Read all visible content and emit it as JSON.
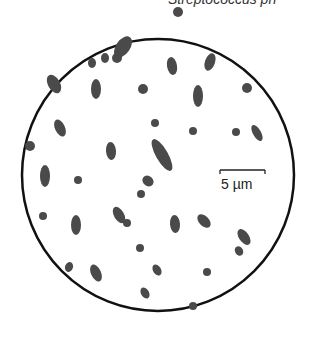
{
  "figure": {
    "caption_partial": "Streptococcus pn",
    "scale_bar_label": "5 µm",
    "colors": {
      "outline": "#111111",
      "cells": "#4a4a4a",
      "background": "#ffffff"
    }
  },
  "field_of_view": {
    "cx": 158,
    "cy": 175,
    "r": 136
  },
  "scale_bar": {
    "x1": 220,
    "x2": 265,
    "y": 170
  },
  "cells": [
    [
      123,
      47,
      12,
      7,
      35
    ],
    [
      117,
      58,
      5,
      5,
      0
    ],
    [
      105,
      58,
      5,
      4,
      0
    ],
    [
      92,
      63,
      5,
      4,
      0
    ],
    [
      54,
      84,
      6,
      10,
      60
    ],
    [
      96,
      89,
      10,
      5,
      0
    ],
    [
      143,
      89,
      5,
      5,
      0
    ],
    [
      178,
      12,
      5,
      5,
      0
    ],
    [
      172,
      66,
      5,
      9,
      80
    ],
    [
      210,
      62,
      9,
      5,
      20
    ],
    [
      198,
      96,
      5,
      11,
      90
    ],
    [
      247,
      88,
      5,
      5,
      0
    ],
    [
      155,
      123,
      4,
      4,
      0
    ],
    [
      60,
      128,
      5,
      9,
      65
    ],
    [
      30,
      146,
      5,
      5,
      0
    ],
    [
      45,
      176,
      11,
      5,
      0
    ],
    [
      78,
      180,
      4,
      4,
      0
    ],
    [
      111,
      151,
      5,
      9,
      85
    ],
    [
      162,
      155,
      6,
      18,
      60
    ],
    [
      148,
      181,
      5,
      6,
      40
    ],
    [
      193,
      131,
      4,
      4,
      0
    ],
    [
      236,
      132,
      4,
      4,
      0
    ],
    [
      257,
      133,
      4,
      9,
      60
    ],
    [
      141,
      194,
      4,
      4,
      0
    ],
    [
      43,
      216,
      4,
      4,
      0
    ],
    [
      76,
      225,
      5,
      10,
      90
    ],
    [
      119,
      215,
      5,
      9,
      60
    ],
    [
      175,
      224,
      5,
      9,
      85
    ],
    [
      204,
      221,
      5,
      8,
      45
    ],
    [
      140,
      248,
      4,
      4,
      0
    ],
    [
      157,
      270,
      4,
      6,
      60
    ],
    [
      244,
      237,
      5,
      9,
      55
    ],
    [
      239,
      251,
      4,
      5,
      60
    ],
    [
      207,
      272,
      4,
      4,
      0
    ],
    [
      69,
      267,
      5,
      4,
      20
    ],
    [
      96,
      273,
      5,
      9,
      65
    ],
    [
      145,
      293,
      4,
      6,
      60
    ],
    [
      193,
      306,
      4,
      4,
      0
    ],
    [
      127,
      223,
      4,
      4,
      0
    ]
  ]
}
